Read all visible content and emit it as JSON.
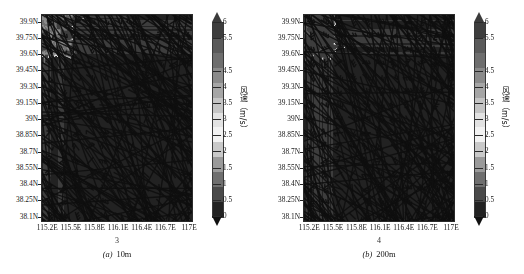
{
  "figure": {
    "type": "two-panel-map",
    "background": "#ffffff",
    "panels": [
      {
        "id": "a",
        "fignum": "3",
        "caption_label": "(a)",
        "caption_text": "10m",
        "height_label": "10m"
      },
      {
        "id": "b",
        "fignum": "4",
        "caption_label": "(b)",
        "caption_text": "200m",
        "height_label": "200m"
      }
    ]
  },
  "axes": {
    "ylabels": [
      "39.9N",
      "39.75N",
      "39.6N",
      "39.45N",
      "39.3N",
      "39.15N",
      "39N",
      "38.85N",
      "38.7N",
      "38.55N",
      "38.4N",
      "38.25N",
      "38.1N"
    ],
    "yvalues": [
      39.9,
      39.75,
      39.6,
      39.45,
      39.3,
      39.15,
      39.0,
      38.85,
      38.7,
      38.55,
      38.4,
      38.25,
      38.1
    ],
    "xlabels": [
      "115.2E",
      "115.5E",
      "115.8E",
      "116.1E",
      "116.4E",
      "116.7E",
      "117E"
    ],
    "xvalues": [
      115.2,
      115.5,
      115.8,
      116.1,
      116.4,
      116.7,
      117.0
    ],
    "ylim": [
      38.05,
      39.97
    ],
    "xlim": [
      115.12,
      117.05
    ]
  },
  "colorbar": {
    "title": "风速（m/s）",
    "ticks": [
      "6",
      "5.5",
      "4.5",
      "4",
      "3.5",
      "3",
      "2.5",
      "2",
      "1.5",
      "1",
      "0.5",
      "0"
    ],
    "tickvalues": [
      6,
      5.5,
      4.5,
      4,
      3.5,
      3,
      2.5,
      2,
      1.5,
      1,
      0.5,
      0
    ],
    "vmin": 0,
    "vmax": 6,
    "extend": "both",
    "colors": [
      "#3d3d3d",
      "#5a5a5a",
      "#6e6e6e",
      "#8a8a8a",
      "#a6a6a6",
      "#c4c4c4",
      "#e2e2e2",
      "#f2f2f2",
      "#c9c9c9",
      "#9a9a9a",
      "#6f6f6f",
      "#4a4a4a",
      "#222222"
    ]
  },
  "chart_data": {
    "type": "heatmap",
    "title": "",
    "xlabel": "",
    "ylabel": "",
    "variable": "风速（m/s）",
    "units": "m/s",
    "xlim": [
      115.12,
      117.05
    ],
    "ylim": [
      38.05,
      39.97
    ],
    "zlim": [
      0,
      6
    ],
    "grid": false,
    "legend_position": "right",
    "overlay": "wind-barbs",
    "panels": [
      {
        "name": "(a) 10m",
        "description": "10 m wind speed, shaded, with wind barbs overlay",
        "notes": "Rough high-speed terrain noise in the NW corner; broad moderate speeds (2.5-3.5 m/s) over the plain; a bright high-speed band (4-5 m/s) running NW-SE through the lower-right, and a secondary bright streak near 39.2N."
      },
      {
        "name": "(b) 200m",
        "description": "200 m wind speed, shaded, with wind barbs overlay",
        "notes": "Stronger and more extensive high-speed shading across the whole northern half; the NW mountain noise is brighter and extends further east; the SE high-speed band is broader than at 10 m."
      }
    ]
  }
}
